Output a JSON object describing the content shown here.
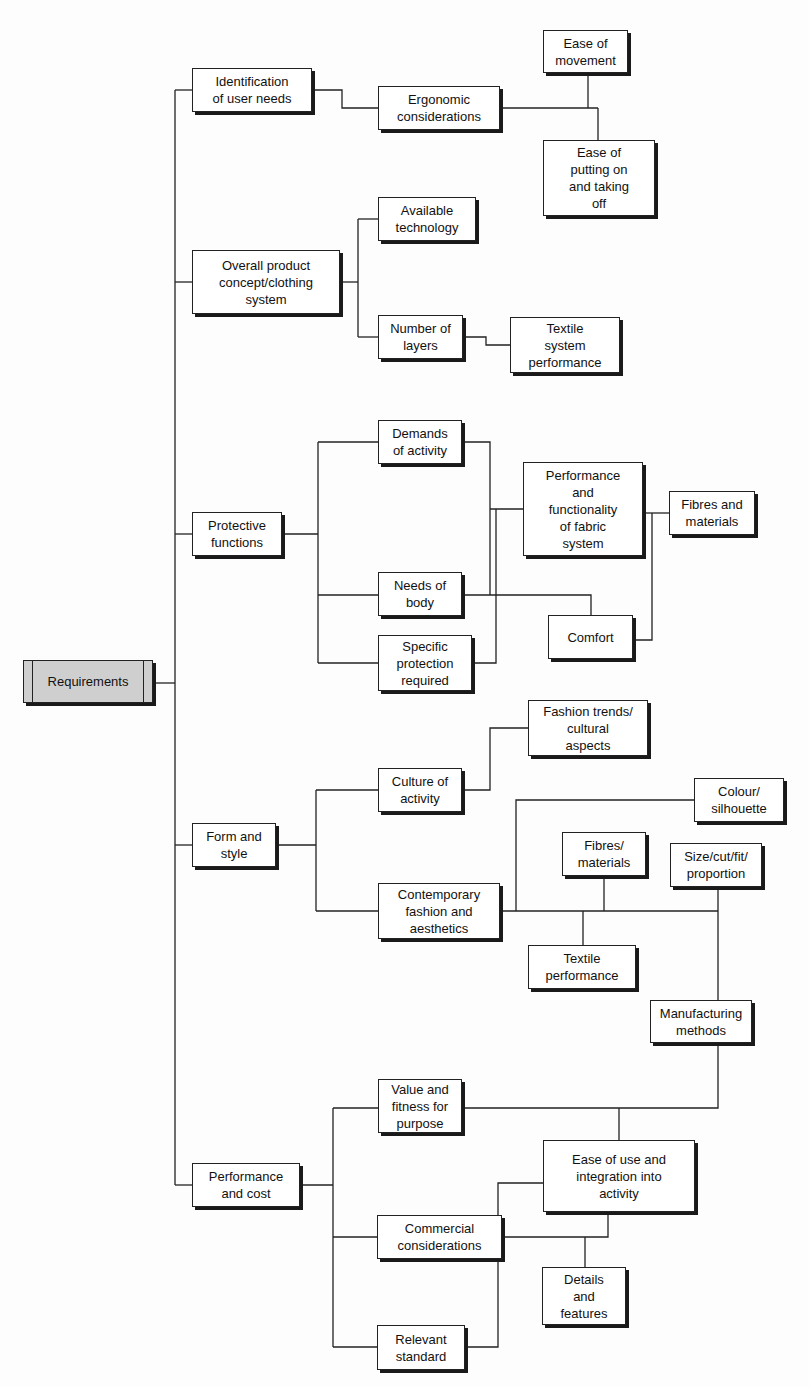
{
  "diagram": {
    "type": "tree",
    "root": "Requirements",
    "nodes": {
      "requirements": {
        "label": "Requirements",
        "x": 23,
        "y": 660,
        "w": 130,
        "h": 43,
        "style": "root"
      },
      "identification": {
        "label": "Identification\nof user needs",
        "x": 192,
        "y": 68,
        "w": 120,
        "h": 44
      },
      "ergonomic": {
        "label": "Ergonomic\nconsiderations",
        "x": 378,
        "y": 86,
        "w": 122,
        "h": 44
      },
      "ease_movement": {
        "label": "Ease of\nmovement",
        "x": 543,
        "y": 30,
        "w": 85,
        "h": 43
      },
      "ease_putting": {
        "label": "Ease of\nputting on\nand taking\noff",
        "x": 543,
        "y": 140,
        "w": 112,
        "h": 76
      },
      "overall": {
        "label": "Overall product\nconcept/clothing\nsystem",
        "x": 192,
        "y": 250,
        "w": 148,
        "h": 64
      },
      "available_tech": {
        "label": "Available\ntechnology",
        "x": 378,
        "y": 197,
        "w": 98,
        "h": 44
      },
      "number_layers": {
        "label": "Number of\nlayers",
        "x": 378,
        "y": 315,
        "w": 85,
        "h": 44
      },
      "textile_system": {
        "label": "Textile\nsystem\nperformance",
        "x": 510,
        "y": 317,
        "w": 110,
        "h": 56
      },
      "protective": {
        "label": "Protective\nfunctions",
        "x": 192,
        "y": 512,
        "w": 90,
        "h": 44
      },
      "demands": {
        "label": "Demands\nof activity",
        "x": 378,
        "y": 420,
        "w": 84,
        "h": 44
      },
      "performance_fabric": {
        "label": "Performance\nand\nfunctionality\nof fabric\nsystem",
        "x": 523,
        "y": 462,
        "w": 120,
        "h": 94
      },
      "fibres_and_materials": {
        "label": "Fibres and\nmaterials",
        "x": 669,
        "y": 491,
        "w": 86,
        "h": 44
      },
      "needs_body": {
        "label": "Needs of\nbody",
        "x": 378,
        "y": 572,
        "w": 84,
        "h": 44
      },
      "comfort": {
        "label": "Comfort",
        "x": 548,
        "y": 615,
        "w": 85,
        "h": 44
      },
      "specific_protection": {
        "label": "Specific\nprotection\nrequired",
        "x": 378,
        "y": 635,
        "w": 94,
        "h": 56
      },
      "fashion_trends": {
        "label": "Fashion trends/\ncultural\naspects",
        "x": 528,
        "y": 700,
        "w": 120,
        "h": 56
      },
      "culture_activity": {
        "label": "Culture of\nactivity",
        "x": 378,
        "y": 768,
        "w": 84,
        "h": 44
      },
      "colour_silhouette": {
        "label": "Colour/\nsilhouette",
        "x": 694,
        "y": 778,
        "w": 90,
        "h": 44
      },
      "form_style": {
        "label": "Form and\nstyle",
        "x": 192,
        "y": 823,
        "w": 84,
        "h": 44
      },
      "fibres_materials2": {
        "label": "Fibres/\nmaterials",
        "x": 562,
        "y": 832,
        "w": 84,
        "h": 44
      },
      "size_cut": {
        "label": "Size/cut/fit/\nproportion",
        "x": 670,
        "y": 843,
        "w": 92,
        "h": 44
      },
      "contemporary": {
        "label": "Contemporary\nfashion and\naesthetics",
        "x": 378,
        "y": 883,
        "w": 122,
        "h": 56
      },
      "textile_performance": {
        "label": "Textile\nperformance",
        "x": 528,
        "y": 945,
        "w": 108,
        "h": 44
      },
      "manufacturing": {
        "label": "Manufacturing\nmethods",
        "x": 650,
        "y": 1000,
        "w": 102,
        "h": 43
      },
      "value_fitness": {
        "label": "Value and\nfitness for\npurpose",
        "x": 378,
        "y": 1079,
        "w": 84,
        "h": 54
      },
      "ease_use": {
        "label": "Ease of use and\nintegration into\nactivity",
        "x": 543,
        "y": 1140,
        "w": 152,
        "h": 72
      },
      "performance_cost": {
        "label": "Performance\nand cost",
        "x": 192,
        "y": 1163,
        "w": 108,
        "h": 44
      },
      "commercial": {
        "label": "Commercial\nconsiderations",
        "x": 377,
        "y": 1215,
        "w": 125,
        "h": 44
      },
      "details": {
        "label": "Details\nand\nfeatures",
        "x": 542,
        "y": 1267,
        "w": 84,
        "h": 58
      },
      "relevant_standard": {
        "label": "Relevant\nstandard",
        "x": 377,
        "y": 1325,
        "w": 88,
        "h": 45
      }
    },
    "edges": [
      [
        "requirements",
        "identification"
      ],
      [
        "requirements",
        "overall"
      ],
      [
        "requirements",
        "protective"
      ],
      [
        "requirements",
        "form_style"
      ],
      [
        "requirements",
        "performance_cost"
      ],
      [
        "identification",
        "ergonomic"
      ],
      [
        "ergonomic",
        "ease_movement"
      ],
      [
        "ergonomic",
        "ease_putting"
      ],
      [
        "overall",
        "available_tech"
      ],
      [
        "overall",
        "number_layers"
      ],
      [
        "number_layers",
        "textile_system"
      ],
      [
        "protective",
        "demands"
      ],
      [
        "protective",
        "needs_body"
      ],
      [
        "protective",
        "specific_protection"
      ],
      [
        "demands",
        "performance_fabric"
      ],
      [
        "needs_body",
        "performance_fabric"
      ],
      [
        "specific_protection",
        "performance_fabric"
      ],
      [
        "needs_body",
        "comfort"
      ],
      [
        "performance_fabric",
        "fibres_and_materials"
      ],
      [
        "comfort",
        "fibres_and_materials"
      ],
      [
        "form_style",
        "culture_activity"
      ],
      [
        "form_style",
        "contemporary"
      ],
      [
        "culture_activity",
        "fashion_trends"
      ],
      [
        "contemporary",
        "colour_silhouette"
      ],
      [
        "contemporary",
        "fibres_materials2"
      ],
      [
        "contemporary",
        "size_cut"
      ],
      [
        "contemporary",
        "textile_performance"
      ],
      [
        "size_cut",
        "manufacturing"
      ],
      [
        "performance_cost",
        "value_fitness"
      ],
      [
        "performance_cost",
        "commercial"
      ],
      [
        "performance_cost",
        "relevant_standard"
      ],
      [
        "value_fitness",
        "manufacturing"
      ],
      [
        "value_fitness",
        "ease_use"
      ],
      [
        "commercial",
        "ease_use"
      ],
      [
        "commercial",
        "details"
      ],
      [
        "relevant_standard",
        "ease_use"
      ]
    ],
    "colors": {
      "line": "#222222",
      "box_fill": "#ffffff",
      "root_fill": "#cfcfcf",
      "shadow": "#1a1a1a",
      "background": "#fdfdfd"
    }
  }
}
